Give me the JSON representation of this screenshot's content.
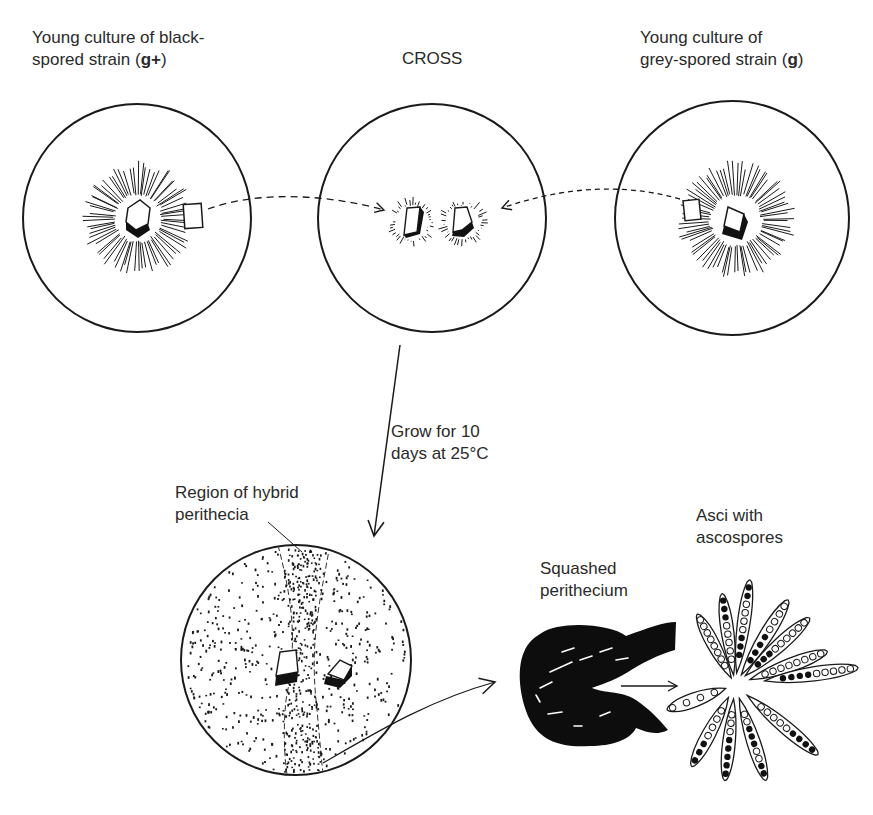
{
  "diagram": {
    "type": "process-illustration"
  },
  "labels": {
    "black_strain": {
      "line1": "Young culture of black-",
      "line2_prefix": "spored strain (",
      "line2_gene": "g+",
      "line2_suffix": ")"
    },
    "cross": "CROSS",
    "grey_strain": {
      "line1": "Young culture of",
      "line2_prefix": "grey-spored strain (",
      "line2_gene": "g",
      "line2_suffix": ")"
    },
    "grow": {
      "line1": "Grow for 10",
      "line2": "days at 25°C"
    },
    "hybrid_region": {
      "line1": "Region of hybrid",
      "line2": "perithecia"
    },
    "squashed": {
      "line1": "Squashed",
      "line2": "perithecium"
    },
    "asci": {
      "line1": "Asci with",
      "line2": "ascospores"
    }
  },
  "plates": [
    {
      "id": "black-strain-plate",
      "cx": 137,
      "cy": 218,
      "r": 114
    },
    {
      "id": "cross-plate",
      "cx": 432,
      "cy": 218,
      "r": 114
    },
    {
      "id": "grey-strain-plate",
      "cx": 732,
      "cy": 218,
      "r": 117
    },
    {
      "id": "result-plate",
      "cx": 296,
      "cy": 660,
      "r": 115
    }
  ],
  "colors": {
    "ink": "#1a1a1a",
    "text": "#2a2a2a",
    "background": "#ffffff"
  }
}
